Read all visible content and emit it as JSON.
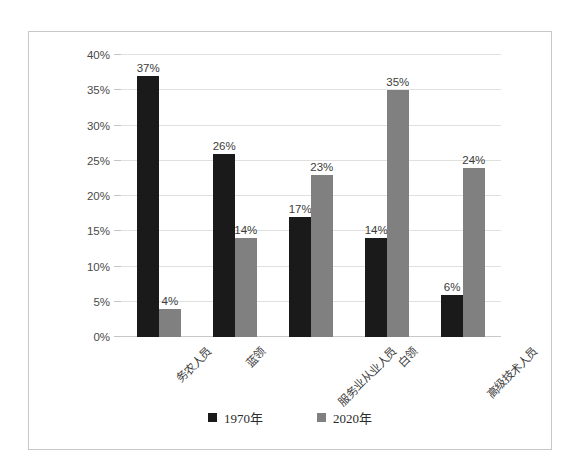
{
  "top_caption": "",
  "chart_data": {
    "type": "bar",
    "title": "",
    "subtitle": "",
    "xlabel": "",
    "ylabel": "",
    "ylim": [
      0,
      40
    ],
    "ytick_labels": [
      "0%",
      "5%",
      "10%",
      "15%",
      "20%",
      "25%",
      "30%",
      "35%",
      "40%"
    ],
    "ytick_values": [
      0,
      5,
      10,
      15,
      20,
      25,
      30,
      35,
      40
    ],
    "grid": true,
    "legend_position": "bottom",
    "categories": [
      "务农人员",
      "蓝领",
      "服务业从业人员",
      "白领",
      "高级技术人员"
    ],
    "series": [
      {
        "name": "1970年",
        "color": "#1a1a1a",
        "values": [
          37,
          26,
          17,
          14,
          6
        ],
        "labels": [
          "37%",
          "26%",
          "17%",
          "14%",
          "6%"
        ]
      },
      {
        "name": "2020年",
        "color": "#808080",
        "values": [
          4,
          14,
          23,
          35,
          24
        ],
        "labels": [
          "4%",
          "14%",
          "23%",
          "35%",
          "24%"
        ]
      }
    ]
  }
}
